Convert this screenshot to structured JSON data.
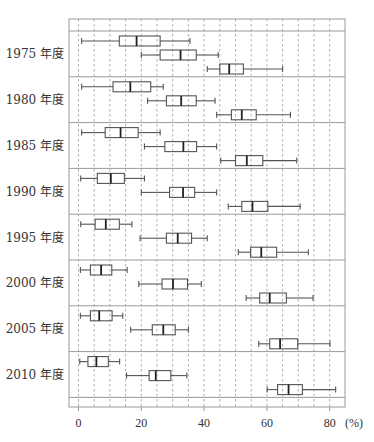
{
  "chart_data": {
    "type": "boxplot",
    "title": "",
    "xlabel": "(%)",
    "ylabel": "",
    "xlim": [
      0,
      85
    ],
    "x_ticks": [
      0,
      20,
      40,
      60,
      80
    ],
    "x_tick_labels": [
      "0",
      "20",
      "40",
      "60",
      "80"
    ],
    "x_unit_label": "(%)",
    "grid": {
      "vertical_dashed_every": 5
    },
    "orientation": "horizontal",
    "groups": [
      {
        "label": "1975 年度",
        "boxes": [
          {
            "min": 1,
            "q1": 13,
            "median": 18.5,
            "q3": 26,
            "max": 35.5
          },
          {
            "min": 20,
            "q1": 26,
            "median": 32.5,
            "q3": 37.5,
            "max": 44.5
          },
          {
            "min": 41,
            "q1": 45,
            "median": 48,
            "q3": 52.5,
            "max": 65
          }
        ]
      },
      {
        "label": "1980 年度",
        "boxes": [
          {
            "min": 1,
            "q1": 11,
            "median": 16.5,
            "q3": 23,
            "max": 27
          },
          {
            "min": 22,
            "q1": 28,
            "median": 32.7,
            "q3": 37.5,
            "max": 43.5
          },
          {
            "min": 44,
            "q1": 48.7,
            "median": 52,
            "q3": 56.6,
            "max": 67.5
          }
        ]
      },
      {
        "label": "1985 年度",
        "boxes": [
          {
            "min": 1,
            "q1": 8.5,
            "median": 13.4,
            "q3": 19,
            "max": 26
          },
          {
            "min": 21,
            "q1": 27.5,
            "median": 33.4,
            "q3": 37.6,
            "max": 44
          },
          {
            "min": 45.3,
            "q1": 50,
            "median": 53.6,
            "q3": 58.7,
            "max": 69.5
          }
        ]
      },
      {
        "label": "1990 年度",
        "boxes": [
          {
            "min": 0.7,
            "q1": 6,
            "median": 10.3,
            "q3": 14.6,
            "max": 21
          },
          {
            "min": 20,
            "q1": 29,
            "median": 33.3,
            "q3": 37,
            "max": 44
          },
          {
            "min": 47.7,
            "q1": 52,
            "median": 55.4,
            "q3": 60.3,
            "max": 70.6
          }
        ]
      },
      {
        "label": "1995 年度",
        "boxes": [
          {
            "min": 0.7,
            "q1": 5.3,
            "median": 8.7,
            "q3": 13,
            "max": 17
          },
          {
            "min": 19.6,
            "q1": 28,
            "median": 31.6,
            "q3": 36,
            "max": 41
          },
          {
            "min": 50.9,
            "q1": 54.8,
            "median": 58.2,
            "q3": 63.1,
            "max": 73.2
          }
        ]
      },
      {
        "label": "2000 年度",
        "boxes": [
          {
            "min": 0.6,
            "q1": 3.8,
            "median": 7.2,
            "q3": 10.6,
            "max": 15.5
          },
          {
            "min": 19.2,
            "q1": 26.6,
            "median": 30.1,
            "q3": 34.7,
            "max": 39.1
          },
          {
            "min": 53.4,
            "q1": 57.7,
            "median": 60.9,
            "q3": 66.2,
            "max": 74.7
          }
        ]
      },
      {
        "label": "2005 年度",
        "boxes": [
          {
            "min": 0.6,
            "q1": 3.8,
            "median": 6.6,
            "q3": 10.7,
            "max": 14.1
          },
          {
            "min": 16.6,
            "q1": 23.5,
            "median": 27,
            "q3": 30.8,
            "max": 35
          },
          {
            "min": 57.4,
            "q1": 60.9,
            "median": 64.2,
            "q3": 69.8,
            "max": 80.1
          }
        ]
      },
      {
        "label": "2010 年度",
        "boxes": [
          {
            "min": 0.4,
            "q1": 3,
            "median": 5.7,
            "q3": 9.5,
            "max": 13.1
          },
          {
            "min": 15.3,
            "q1": 22.5,
            "median": 24.6,
            "q3": 29.4,
            "max": 34.5
          },
          {
            "min": 60.1,
            "q1": 63.4,
            "median": 66.9,
            "q3": 71.3,
            "max": 81.9
          }
        ]
      }
    ]
  },
  "colors": {
    "frame": "#9a9a9a",
    "grid": "#9a9a9a",
    "box": "#555555",
    "text": "#333333"
  }
}
